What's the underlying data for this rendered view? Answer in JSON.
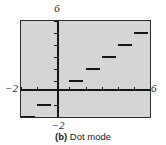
{
  "figure": {
    "caption_tag": "(b)",
    "caption_text": "Dot mode"
  },
  "axis_labels": {
    "top": "6",
    "left": "−2",
    "right": "6",
    "bottom": "−2"
  },
  "colors": {
    "screen_background": "#d5d5d5",
    "ink": "#141414",
    "border": "#2b2b2b",
    "page_background": "#ffffff"
  },
  "chart_data": {
    "type": "line",
    "subtitle": "Graphing calculator screen showing a greatest-integer (step) function plotted in dot mode",
    "xlabel": "",
    "ylabel": "",
    "xlim": [
      -2,
      6
    ],
    "ylim": [
      -2,
      6
    ],
    "grid": false,
    "legend": null,
    "x_ticks": [
      -2,
      -1,
      0,
      1,
      2,
      3,
      4,
      5,
      6
    ],
    "y_ticks": [
      -2,
      -1,
      0,
      1,
      2,
      3,
      4,
      5,
      6
    ],
    "x_tick_labels": [
      "−2",
      "",
      "",
      "",
      "",
      "",
      "",
      "",
      "6"
    ],
    "y_tick_labels": [
      "−2",
      "",
      "",
      "",
      "",
      "",
      "",
      "",
      "6"
    ],
    "series": [
      {
        "name": "y = int(x)",
        "style": "dot-mode step segments",
        "segments": [
          {
            "x_start": -2,
            "x_end": -1,
            "y": -2
          },
          {
            "x_start": -1,
            "x_end": 0,
            "y": -1
          },
          {
            "x_start": 1,
            "x_end": 2,
            "y": 1
          },
          {
            "x_start": 2,
            "x_end": 3,
            "y": 2
          },
          {
            "x_start": 3,
            "x_end": 4,
            "y": 3
          },
          {
            "x_start": 4,
            "x_end": 5,
            "y": 4
          },
          {
            "x_start": 5,
            "x_end": 6,
            "y": 5
          }
        ]
      }
    ]
  }
}
